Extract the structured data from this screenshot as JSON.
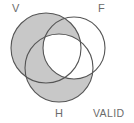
{
  "figure": {
    "caption": "VALID",
    "background_color": "#ffffff",
    "shade_color": "#c8c8c8",
    "stroke_color": "#555555",
    "unshaded_color": "#ffffff"
  },
  "sets": [
    {
      "key": "V",
      "label": "V",
      "cx": 46,
      "cy": 48,
      "r": 35,
      "shaded": true
    },
    {
      "key": "F",
      "label": "F",
      "cx": 74,
      "cy": 48,
      "r": 31,
      "shaded": false
    },
    {
      "key": "H",
      "label": "H",
      "cx": 59,
      "cy": 68,
      "r": 34,
      "shaded": true
    }
  ],
  "labels": {
    "v": {
      "text": "V",
      "x": 12,
      "y": 12
    },
    "f": {
      "text": "F",
      "x": 98,
      "y": 12
    },
    "h": {
      "text": "H",
      "x": 55,
      "y": 117
    },
    "valid": {
      "text": "VALID",
      "x": 93,
      "y": 117
    }
  },
  "regions": [
    {
      "name": "V-only",
      "shaded": true
    },
    {
      "name": "F-only",
      "shaded": false
    },
    {
      "name": "H-only",
      "shaded": true
    },
    {
      "name": "V-and-F",
      "shaded": true
    },
    {
      "name": "V-and-H",
      "shaded": true
    },
    {
      "name": "F-and-H",
      "shaded": false
    },
    {
      "name": "V-and-F-and-H",
      "shaded": false
    }
  ]
}
